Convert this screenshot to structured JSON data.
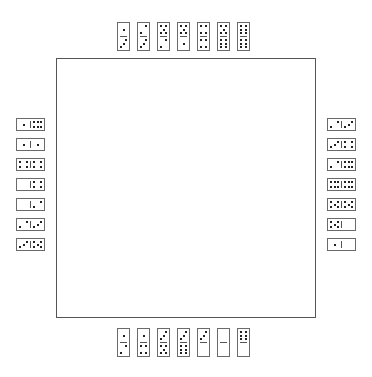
{
  "game": {
    "name": "dominoes",
    "board": {
      "label": ""
    },
    "hands": {
      "top": [
        [
          1,
          3
        ],
        [
          2,
          3
        ],
        [
          5,
          2
        ],
        [
          5,
          1
        ],
        [
          4,
          4
        ],
        [
          5,
          6
        ],
        [
          6,
          6
        ]
      ],
      "left": [
        [
          1,
          6
        ],
        [
          1,
          1
        ],
        [
          4,
          4
        ],
        [
          0,
          4
        ],
        [
          0,
          2
        ],
        [
          2,
          3
        ],
        [
          3,
          5
        ]
      ],
      "right": [
        [
          2,
          3
        ],
        [
          3,
          4
        ],
        [
          2,
          6
        ],
        [
          6,
          6
        ],
        [
          5,
          5
        ],
        [
          5,
          0
        ],
        [
          1,
          0
        ]
      ],
      "bottom": [
        [
          1,
          2
        ],
        [
          1,
          4
        ],
        [
          3,
          5
        ],
        [
          3,
          6
        ],
        [
          3,
          0
        ],
        [
          0,
          0
        ],
        [
          6,
          0
        ]
      ]
    }
  },
  "colors": {
    "board_border": "#555555",
    "domino_border": "#6a6a6a",
    "pip": "#222222",
    "background": "#ffffff"
  }
}
